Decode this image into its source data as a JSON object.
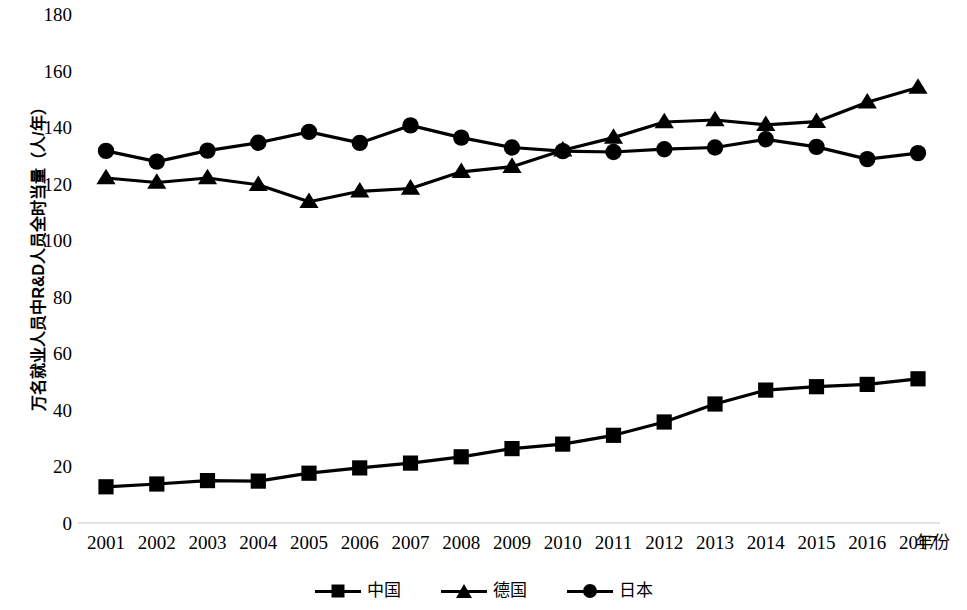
{
  "chart_data": {
    "type": "line",
    "title": "",
    "xlabel": "年份",
    "ylabel": "万名就业人员中R&D人员全时当量（人/年）",
    "categories": [
      "2001",
      "2002",
      "2003",
      "2004",
      "2005",
      "2006",
      "2007",
      "2008",
      "2009",
      "2010",
      "2011",
      "2012",
      "2013",
      "2014",
      "2015",
      "2016",
      "2017"
    ],
    "x": [
      2001,
      2002,
      2003,
      2004,
      2005,
      2006,
      2007,
      2008,
      2009,
      2010,
      2011,
      2012,
      2013,
      2014,
      2015,
      2016,
      2017
    ],
    "ylim": [
      0,
      180
    ],
    "y_ticks": [
      0,
      20,
      40,
      60,
      80,
      100,
      120,
      140,
      160,
      180
    ],
    "y_tick_labels": [
      "0",
      "20",
      "40",
      "60",
      "80",
      "100",
      "120",
      "140",
      "160",
      "180"
    ],
    "grid": false,
    "legend_position": "bottom-center",
    "series": [
      {
        "name": "中国",
        "marker": "square",
        "color": "#000000",
        "values": [
          12.8,
          13.8,
          15.0,
          14.8,
          17.6,
          19.5,
          21.2,
          23.4,
          26.3,
          27.9,
          31.0,
          35.7,
          42.1,
          47.0,
          48.2,
          49.0,
          51.0
        ]
      },
      {
        "name": "德国",
        "marker": "triangle",
        "color": "#000000",
        "values": [
          122.0,
          120.4,
          122.0,
          119.6,
          113.6,
          117.3,
          118.3,
          124.2,
          126.0,
          131.8,
          136.3,
          141.8,
          142.5,
          140.8,
          141.9,
          148.8,
          154.0
        ]
      },
      {
        "name": "日本",
        "marker": "circle",
        "color": "#000000",
        "values": [
          131.6,
          127.8,
          131.7,
          134.5,
          138.3,
          134.4,
          140.6,
          136.3,
          132.8,
          131.5,
          131.2,
          132.2,
          132.8,
          135.7,
          133.0,
          128.7,
          130.8
        ]
      }
    ]
  },
  "axes": {
    "y_title": "万名就业人员中R&D人员全时当量（人/年）",
    "x_title": "年份"
  },
  "legend": {
    "items": [
      {
        "label": "中国",
        "marker": "square-marker"
      },
      {
        "label": "德国",
        "marker": "triangle-marker"
      },
      {
        "label": "日本",
        "marker": "circle-marker"
      }
    ]
  }
}
